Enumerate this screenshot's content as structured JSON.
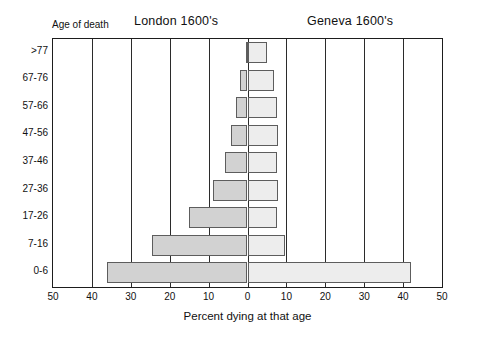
{
  "chart_data": {
    "type": "bar",
    "subtype": "population-pyramid",
    "title": "",
    "xlabel": "Percent dying at that age",
    "ylabel": "Age of death",
    "categories": [
      "0-6",
      "7-16",
      "17-26",
      "27-36",
      "37-46",
      "47-56",
      "57-66",
      "67-76",
      ">77"
    ],
    "categories_top_to_bottom": [
      ">77",
      "67-76",
      "57-66",
      "47-56",
      "37-46",
      "27-36",
      "17-26",
      "7-16",
      "0-6"
    ],
    "series": [
      {
        "name": "London 1600's",
        "side": "left",
        "color": "#d2d2d2",
        "values_top_to_bottom": [
          0.4,
          1.8,
          3.0,
          4.2,
          5.8,
          8.8,
          15.0,
          24.5,
          36.0
        ]
      },
      {
        "name": "Geneva 1600's",
        "side": "right",
        "color": "#ededed",
        "values_top_to_bottom": [
          5.0,
          6.7,
          7.5,
          7.8,
          7.6,
          7.8,
          7.7,
          9.6,
          42.0
        ]
      }
    ],
    "xlim": [
      -50,
      50
    ],
    "xticks": [
      -50,
      -40,
      -30,
      -20,
      -10,
      0,
      10,
      20,
      30,
      40,
      50
    ],
    "xtick_labels": [
      "50",
      "40",
      "30",
      "20",
      "10",
      "0",
      "10",
      "20",
      "30",
      "40",
      "50"
    ],
    "grid": true,
    "grid_axis": "x",
    "legend": "none"
  },
  "titles": {
    "left_panel": "London 1600's",
    "right_panel": "Geneva 1600's",
    "y_axis_corner": "Age of death",
    "x_axis": "Percent dying at that age"
  }
}
